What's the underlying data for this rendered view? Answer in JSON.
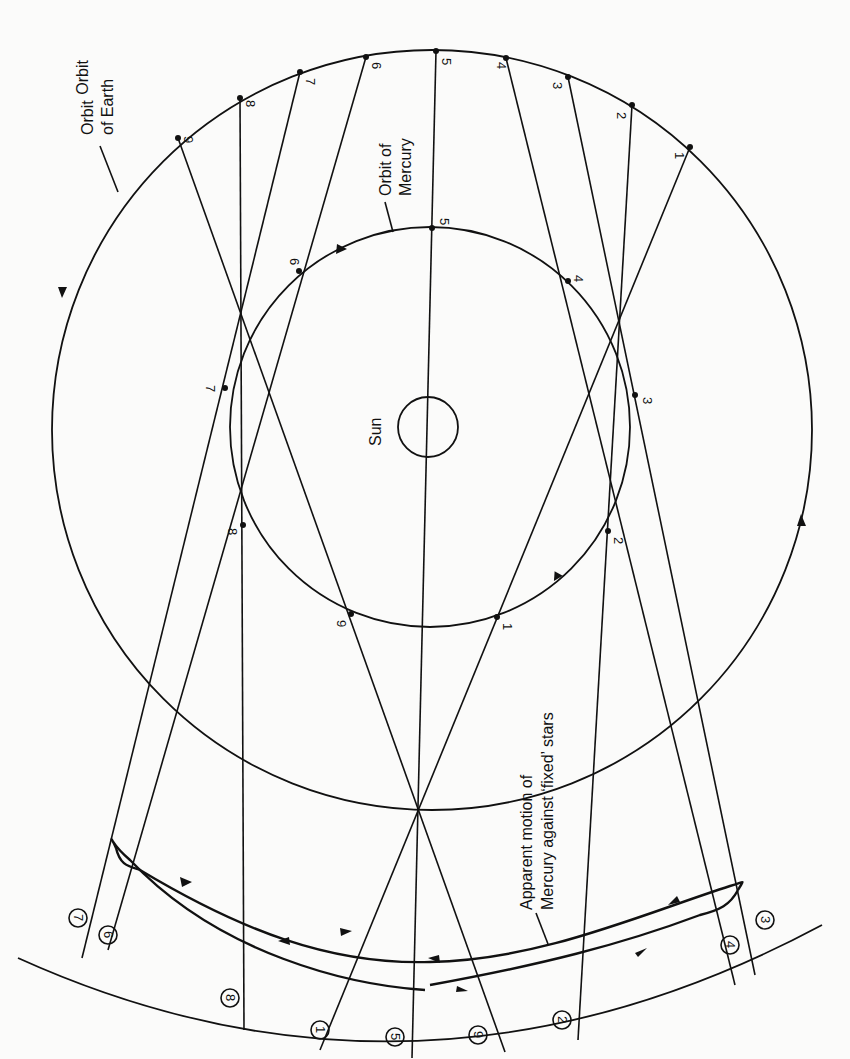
{
  "diagram": {
    "labels": {
      "orbit_earth_line1": "Orbit",
      "orbit_earth_line2": "of Earth",
      "orbit_mercury_line1": "Orbit of",
      "orbit_mercury_line2": "Mercury",
      "sun": "Sun",
      "apparent_line1": "Apparent motion of",
      "apparent_line2": "Mercury against ‘fixed’ stars"
    },
    "earth_positions": [
      "1",
      "2",
      "3",
      "4",
      "5",
      "6",
      "7",
      "8",
      "9"
    ],
    "mercury_positions": [
      "1",
      "2",
      "3",
      "4",
      "5",
      "6",
      "7",
      "8",
      "9"
    ],
    "star_positions": [
      "1",
      "2",
      "3",
      "4",
      "5",
      "6",
      "7",
      "8",
      "9"
    ],
    "colors": {
      "ink": "#111111",
      "paper": "#fbfbfa"
    }
  }
}
